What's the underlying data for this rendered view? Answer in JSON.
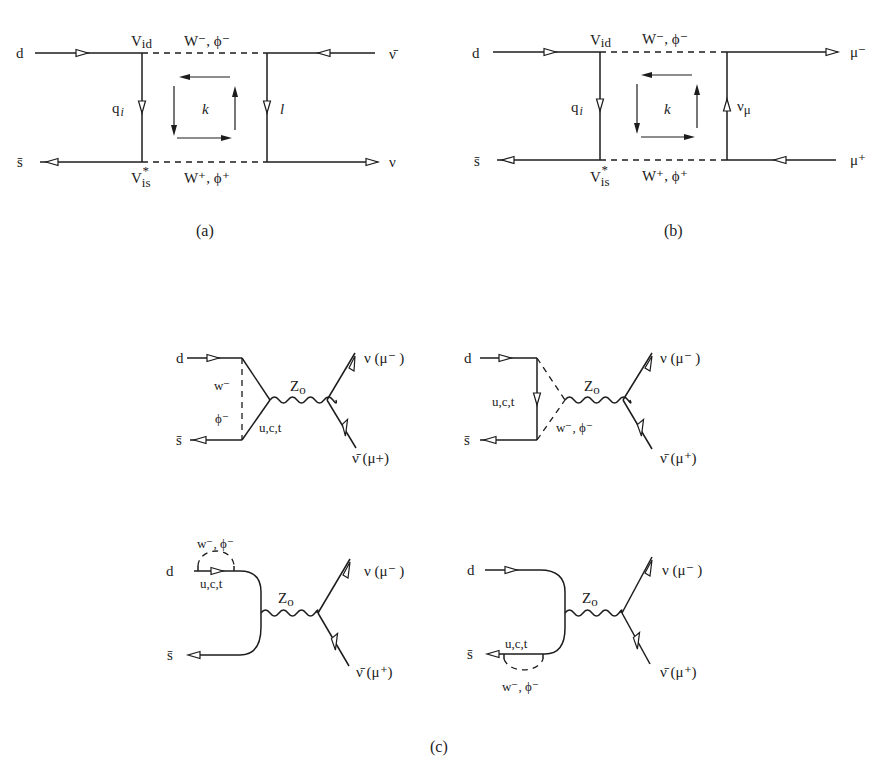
{
  "figure": {
    "panel_a": {
      "caption": "(a)",
      "labels": {
        "d": "d",
        "sbar": "s̄",
        "vid_V": "V",
        "vid_sub": "id",
        "vis_V": "V",
        "vis_sub": "is",
        "vis_sup": "*",
        "w_top": "W⁻, ϕ⁻",
        "w_bottom": "W⁺, ϕ⁺",
        "q": "q",
        "q_sub": "i",
        "k": "k",
        "l": "l",
        "nubar": "ν̄",
        "nu": "ν"
      }
    },
    "panel_b": {
      "caption": "(b)",
      "labels": {
        "d": "d",
        "sbar": "s̄",
        "vid_V": "V",
        "vid_sub": "id",
        "vis_V": "V",
        "vis_sub": "is",
        "vis_sup": "*",
        "w_top": "W⁻, ϕ⁻",
        "w_bottom": "W⁺, ϕ⁺",
        "q": "q",
        "q_sub": "i",
        "k": "k",
        "numu": "ν",
        "numu_sub": "μ",
        "mu_minus": "μ⁻",
        "mu_plus": "μ⁺"
      }
    },
    "panel_c": {
      "caption": "(c)",
      "diagrams": [
        {
          "d": "d",
          "sbar": "s̄",
          "w": "w⁻",
          "phi": "ϕ⁻",
          "quarks": "u,c,t",
          "z": "Z",
          "z_sub": "o",
          "out_top": "ν (μ⁻ )",
          "out_bottom": "ν̄  (μ+)"
        },
        {
          "d": "d",
          "sbar": "s̄",
          "quarks": "u,c,t",
          "w": "w⁻, ϕ⁻",
          "z": "Z",
          "z_sub": "o",
          "out_top": "ν  (μ⁻ )",
          "out_bottom": "ν̄  (μ⁺)"
        },
        {
          "d": "d",
          "sbar": "s̄",
          "w": "w⁻, ϕ⁻",
          "quarks": "u,c,t",
          "z": "Z",
          "z_sub": "o",
          "out_top": "ν  (μ⁻ )",
          "out_bottom": "ν̄  (μ⁺)"
        },
        {
          "d": "d",
          "sbar": "s̄",
          "quarks": "u,c,t",
          "w": "w⁻, ϕ⁻",
          "z": "Z",
          "z_sub": "o",
          "out_top": "ν  (μ⁻ )",
          "out_bottom": "ν̄  (μ⁺)"
        }
      ]
    }
  }
}
